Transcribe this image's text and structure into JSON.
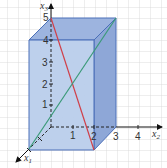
{
  "diagram": {
    "type": "3d-cuboid-coordinate-system",
    "axes": {
      "x1": {
        "label": "x",
        "sub": "1"
      },
      "x2": {
        "label": "x",
        "sub": "2",
        "ticks": [
          "1",
          "2",
          "3",
          "4"
        ]
      },
      "x3": {
        "label": "x",
        "sub": "3",
        "ticks": [
          "1",
          "2",
          "3",
          "4",
          "5"
        ]
      }
    },
    "cuboid": {
      "dimensions": {
        "x1": 2,
        "x2": 3,
        "x3": 5
      },
      "colors": {
        "front": "#b9cdeb",
        "top": "#9db4df",
        "side": "#8ea7d7",
        "edge": "#4a6fb8"
      }
    },
    "diagonals": [
      {
        "name": "red-diagonal",
        "color": "#d0404a",
        "from": "back-top-left",
        "to": "front-bottom-right"
      },
      {
        "name": "green-diagonal",
        "color": "#3a9a78",
        "from": "front-bottom-left",
        "to": "back-top-right"
      }
    ],
    "grid": {
      "spacing": 11,
      "color": "#d6d6d6"
    }
  }
}
